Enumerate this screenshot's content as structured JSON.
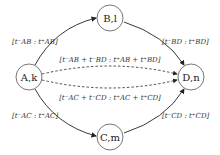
{
  "diagram": {
    "type": "directed-graph",
    "nodes": [
      {
        "id": "A",
        "label": "A,k",
        "main": "A",
        "sub": "k"
      },
      {
        "id": "B",
        "label": "B,l",
        "main": "B",
        "sub": "l"
      },
      {
        "id": "C",
        "label": "C,m",
        "main": "C",
        "sub": "m"
      },
      {
        "id": "D",
        "label": "D,n",
        "main": "D",
        "sub": "n"
      }
    ],
    "edges": [
      {
        "from": "A",
        "to": "B",
        "style": "solid",
        "label": "[t⁻AB : t⁺AB]",
        "parts": [
          "[t",
          "−",
          "AB",
          " : t",
          "+",
          "AB",
          "]"
        ]
      },
      {
        "from": "B",
        "to": "D",
        "style": "solid",
        "label": "[t⁻BD : t⁺BD]",
        "parts": [
          "[t",
          "−",
          "BD",
          " : t",
          "+",
          "BD",
          "]"
        ]
      },
      {
        "from": "A",
        "to": "C",
        "style": "solid",
        "label": "[t⁻AC : t⁺AC]",
        "parts": [
          "[t",
          "−",
          "AC",
          " : t",
          "+",
          "AC",
          "]"
        ]
      },
      {
        "from": "C",
        "to": "D",
        "style": "solid",
        "label": "[t⁻CD : t⁺CD]",
        "parts": [
          "[t",
          "−",
          "CD",
          " : t",
          "+",
          "CD",
          "]"
        ]
      },
      {
        "from": "A",
        "to": "D",
        "style": "dashed",
        "via": "B",
        "label": "[t⁻AB + t⁻BD : t⁺AB + t⁺BD]"
      },
      {
        "from": "A",
        "to": "D",
        "style": "dashed",
        "via": "C",
        "label": "[t⁻AC + t⁻CD : t⁺AC + t⁺CD]"
      }
    ]
  }
}
